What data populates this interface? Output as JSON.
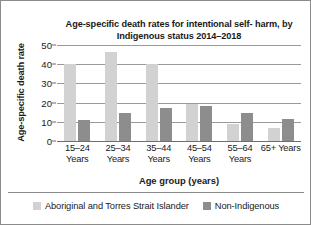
{
  "chart_data": {
    "type": "bar",
    "title_line1": "Age-specific death rates for intentional self-",
    "title_line2": "harm, by Indigenous status 2014–2018",
    "xlabel": "Age group (years)",
    "ylabel": "Age-specific death rate",
    "categories": [
      "15–24 Years",
      "25–34 Years",
      "35–44 Years",
      "45–54 Years",
      "55–64 Years",
      "65+ Years"
    ],
    "category_lines": [
      {
        "line1": "15–24",
        "line2": "Years"
      },
      {
        "line1": "25–34",
        "line2": "Years"
      },
      {
        "line1": "35–44",
        "line2": "Years"
      },
      {
        "line1": "45–54",
        "line2": "Years"
      },
      {
        "line1": "55–64",
        "line2": "Years"
      },
      {
        "line1": "65+ Years",
        "line2": ""
      }
    ],
    "series": [
      {
        "name": "Aboriginal and Torres Strait Islander",
        "color": "#d2d2d2",
        "values": [
          40,
          46.5,
          40,
          19.5,
          9,
          7
        ]
      },
      {
        "name": "Non-Indigenous",
        "color": "#8d8d8d",
        "values": [
          11,
          14.5,
          17,
          18,
          14.5,
          11.5
        ]
      }
    ],
    "ylim": [
      0,
      50
    ],
    "yticks": [
      0,
      10,
      20,
      30,
      40,
      50
    ],
    "ytick_labels": [
      "0",
      "10",
      "20",
      "30",
      "40",
      "50"
    ],
    "grid": true,
    "legend_position": "bottom"
  }
}
